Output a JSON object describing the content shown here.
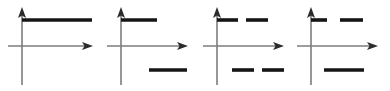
{
  "figure": {
    "title": "",
    "background_color": "#ffffff",
    "width": 390,
    "height": 91,
    "panel_count": 4,
    "axis_color": "#7d7d7d",
    "arrow_color": "#2b2b2b",
    "signal_color": "#151515"
  },
  "chart_data": {
    "type": "line",
    "title": "",
    "subtitle": "",
    "xlabel": "",
    "ylabel": "",
    "grid": false,
    "legend": null,
    "panels": [
      {
        "id": "panel-1",
        "index": 1,
        "axes": {
          "y_axis": {
            "x": 22,
            "y_top": 8,
            "y_bottom": 85,
            "arrow": "up",
            "arrow_tip_y": 8
          },
          "x_axis": {
            "y": 46,
            "x_left": 8,
            "x_right": 92,
            "arrow": "right",
            "arrow_tip_x": 92
          }
        },
        "segments": [
          {
            "name": "upper-long-line",
            "x1": 22,
            "x2": 92,
            "y": 20,
            "side": "above",
            "length": 70
          }
        ]
      },
      {
        "id": "panel-2",
        "index": 2,
        "axes": {
          "y_axis": {
            "x": 121,
            "y_top": 8,
            "y_bottom": 85,
            "arrow": "up",
            "arrow_tip_y": 8
          },
          "x_axis": {
            "y": 46,
            "x_left": 107,
            "x_right": 187,
            "arrow": "right",
            "arrow_tip_x": 187
          }
        },
        "segments": [
          {
            "name": "upper-left-line",
            "x1": 121,
            "x2": 157,
            "y": 20,
            "side": "above",
            "length": 36
          },
          {
            "name": "lower-right-line",
            "x1": 149,
            "x2": 187,
            "y": 70,
            "side": "below",
            "length": 38
          }
        ]
      },
      {
        "id": "panel-3",
        "index": 3,
        "axes": {
          "y_axis": {
            "x": 217,
            "y_top": 8,
            "y_bottom": 85,
            "arrow": "up",
            "arrow_tip_y": 8
          },
          "x_axis": {
            "y": 46,
            "x_left": 203,
            "x_right": 283,
            "arrow": "right",
            "arrow_tip_x": 283
          }
        },
        "segments": [
          {
            "name": "upper-left-dash",
            "x1": 217,
            "x2": 238,
            "y": 20,
            "side": "above",
            "length": 21
          },
          {
            "name": "upper-right-dash",
            "x1": 246,
            "x2": 268,
            "y": 20,
            "side": "above",
            "length": 22
          },
          {
            "name": "lower-left-dash",
            "x1": 232,
            "x2": 254,
            "y": 70,
            "side": "below",
            "length": 22
          },
          {
            "name": "lower-right-dash",
            "x1": 262,
            "x2": 284,
            "y": 70,
            "side": "below",
            "length": 22
          }
        ]
      },
      {
        "id": "panel-4",
        "index": 4,
        "axes": {
          "y_axis": {
            "x": 311,
            "y_top": 8,
            "y_bottom": 85,
            "arrow": "up",
            "arrow_tip_y": 8
          },
          "x_axis": {
            "y": 46,
            "x_left": 297,
            "x_right": 377,
            "arrow": "right",
            "arrow_tip_x": 377
          }
        },
        "segments": [
          {
            "name": "upper-left-dash",
            "x1": 311,
            "x2": 327,
            "y": 20,
            "side": "above",
            "length": 16
          },
          {
            "name": "upper-right-dash",
            "x1": 340,
            "x2": 363,
            "y": 20,
            "side": "above",
            "length": 23
          },
          {
            "name": "lower-center-line",
            "x1": 324,
            "x2": 364,
            "y": 70,
            "side": "below",
            "length": 40
          }
        ]
      }
    ]
  }
}
